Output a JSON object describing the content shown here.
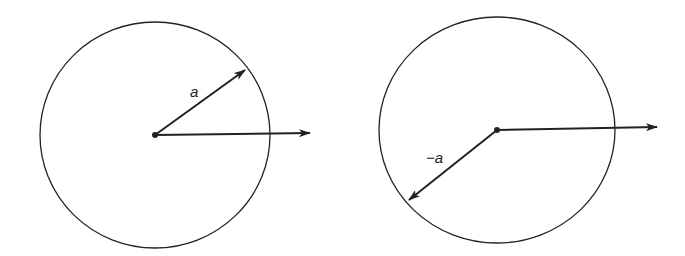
{
  "diagrams": [
    {
      "name": "vector-a",
      "circle": {
        "cx": 155,
        "cy": 135,
        "rx": 115,
        "ry": 113
      },
      "center_dot": {
        "x": 155,
        "y": 135
      },
      "reference_arrow": {
        "x1": 155,
        "y1": 135,
        "x2": 310,
        "y2": 133
      },
      "vector_arrow": {
        "x1": 155,
        "y1": 135,
        "x2": 245,
        "y2": 70
      },
      "label": {
        "text": "a",
        "x": 190,
        "y": 97
      }
    },
    {
      "name": "vector-minus-a",
      "circle": {
        "cx": 497,
        "cy": 130,
        "rx": 118,
        "ry": 113
      },
      "center_dot": {
        "x": 497,
        "y": 130
      },
      "reference_arrow": {
        "x1": 497,
        "y1": 130,
        "x2": 657,
        "y2": 127
      },
      "vector_arrow": {
        "x1": 497,
        "y1": 130,
        "x2": 409,
        "y2": 200
      },
      "label": {
        "text": "−a",
        "x": 426,
        "y": 163
      }
    }
  ],
  "colors": {
    "stroke": "#222222",
    "background": "#ffffff"
  }
}
